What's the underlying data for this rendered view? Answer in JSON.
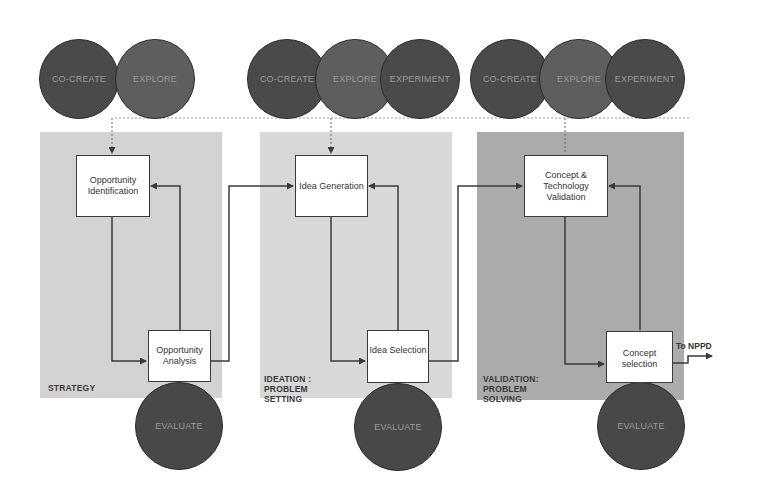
{
  "diagram": {
    "phases": [
      {
        "id": "strategy",
        "label": "STRATEGY",
        "color": "#d2d2d2",
        "top_circles": [
          "CO-CREATE",
          "EXPLORE"
        ],
        "upper_box": "Opportunity Identification",
        "lower_box": "Opportunity Analysis",
        "bottom_circle": "EVALUATE"
      },
      {
        "id": "ideation",
        "label_lines": [
          "IDEATION :",
          "PROBLEM",
          "SETTING"
        ],
        "color": "#d6d6d6",
        "top_circles": [
          "CO-CREATE",
          "EXPLORE",
          "EXPERIMENT"
        ],
        "upper_box": "Idea Generation",
        "lower_box": "Idea Selection",
        "bottom_circle": "EVALUATE"
      },
      {
        "id": "validation",
        "label_lines": [
          "VALIDATION:",
          "PROBLEM",
          "SOLVING"
        ],
        "color": "#ababab",
        "top_circles": [
          "CO-CREATE",
          "EXPLORE",
          "EXPERIMENT"
        ],
        "upper_box": "Concept & Technology Validation",
        "lower_box": "Concept selection",
        "bottom_circle": "EVALUATE"
      }
    ],
    "output_label": "To NPPD",
    "colors": {
      "circle_dark": "#4a4a4a",
      "circle_mid": "#5e5e5e",
      "circle_text": "#9a9a9a",
      "line": "#3a3a3a"
    }
  }
}
